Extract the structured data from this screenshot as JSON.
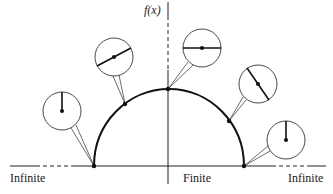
{
  "diagram": {
    "type": "semicircle-with-callouts",
    "axis": {
      "y_label": "f(x)",
      "x_labels": {
        "left": "Infinite",
        "center": "Finite",
        "right": "Infinite"
      }
    },
    "arc": {
      "description": "Semicircular curve f(x) on a finite support, falling to zero at both ends",
      "points": [
        {
          "id": "left-base",
          "x": 94,
          "y": 166
        },
        {
          "id": "upper-left",
          "x": 125,
          "y": 104
        },
        {
          "id": "top",
          "x": 168,
          "y": 89
        },
        {
          "id": "upper-right",
          "x": 229,
          "y": 121
        },
        {
          "id": "right-base",
          "x": 244,
          "y": 166
        }
      ]
    },
    "callouts": [
      {
        "id": "left-base",
        "cx": 62,
        "cy": 111,
        "r": 19,
        "needle": "vertical-up"
      },
      {
        "id": "upper-left",
        "cx": 114,
        "cy": 57,
        "r": 19,
        "needle": "diagonal-ascending"
      },
      {
        "id": "top",
        "cx": 202,
        "cy": 48,
        "r": 19,
        "needle": "horizontal"
      },
      {
        "id": "upper-right",
        "cx": 258,
        "cy": 84,
        "r": 19,
        "needle": "diagonal-descending"
      },
      {
        "id": "right-base",
        "cx": 286,
        "cy": 140,
        "r": 19,
        "needle": "vertical-up"
      }
    ]
  }
}
